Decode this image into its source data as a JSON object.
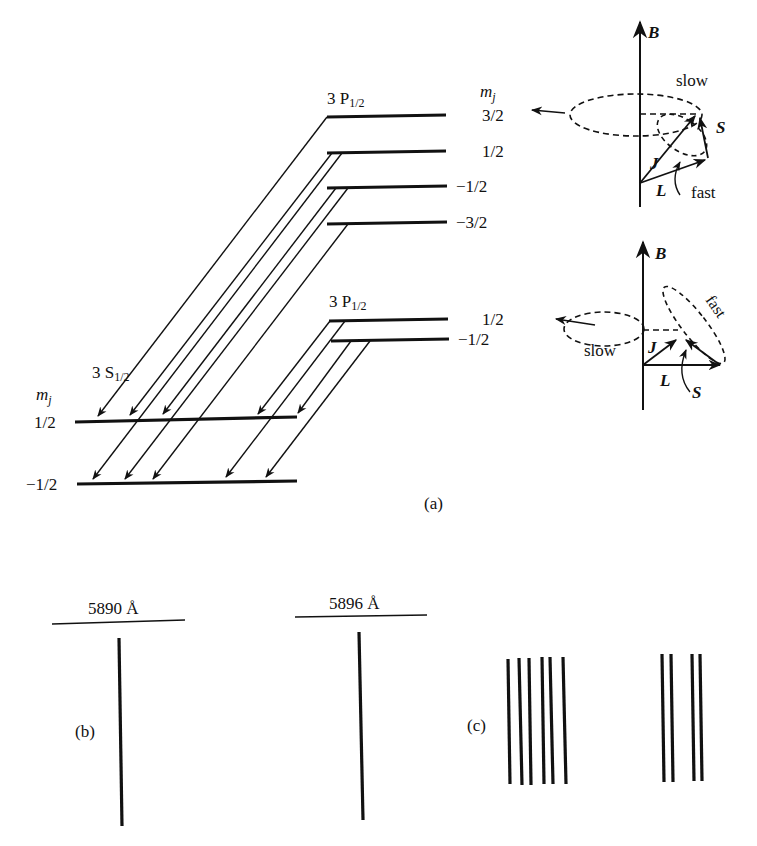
{
  "figure": {
    "panel_a": {
      "label": "(a)",
      "upper_level": {
        "term": "3 P",
        "term_sub": "1/2",
        "mj_header": "m",
        "mj_header_sub": "j",
        "mj_values": [
          "3/2",
          "1/2",
          "−1/2",
          "−3/2"
        ]
      },
      "lower_p_level": {
        "term": "3 P",
        "term_sub": "1/2",
        "mj_values": [
          "1/2",
          "−1/2"
        ]
      },
      "ground_level": {
        "term": "3 S",
        "term_sub": "1/2",
        "mj_header": "m",
        "mj_header_sub": "j",
        "mj_values": [
          "1/2",
          "−1/2"
        ]
      },
      "vector_model_top": {
        "field": "B",
        "precession_outer": "slow",
        "precession_inner": "fast",
        "vectors": [
          "J",
          "L",
          "S"
        ]
      },
      "vector_model_bottom": {
        "field": "B",
        "precession_outer": "slow",
        "precession_inner": "fast",
        "vectors": [
          "J",
          "L",
          "S"
        ]
      }
    },
    "panel_b": {
      "label": "(b)",
      "lines": [
        {
          "wavelength": "5890 Å"
        },
        {
          "wavelength": "5896 Å"
        }
      ]
    },
    "panel_c": {
      "label": "(c)",
      "group1_count": 6,
      "group2_count": 4
    }
  }
}
